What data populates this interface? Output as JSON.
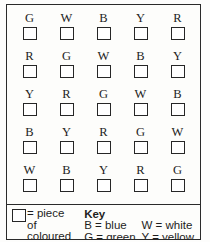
{
  "grid": {
    "rows": [
      [
        "G",
        "W",
        "B",
        "Y",
        "R"
      ],
      [
        "R",
        "G",
        "W",
        "B",
        "Y"
      ],
      [
        "Y",
        "R",
        "G",
        "W",
        "B"
      ],
      [
        "B",
        "Y",
        "R",
        "G",
        "W"
      ],
      [
        "W",
        "B",
        "Y",
        "R",
        "G"
      ]
    ]
  },
  "key": {
    "swatch_caption": {
      "line1": "= piece",
      "line2": "of",
      "line3": "coloured",
      "line4": "bead"
    },
    "title": "Key",
    "entries_col1": [
      "B = blue",
      "G = green",
      "R = red"
    ],
    "entries_col2": [
      "W = white",
      "Y = yellow"
    ]
  }
}
